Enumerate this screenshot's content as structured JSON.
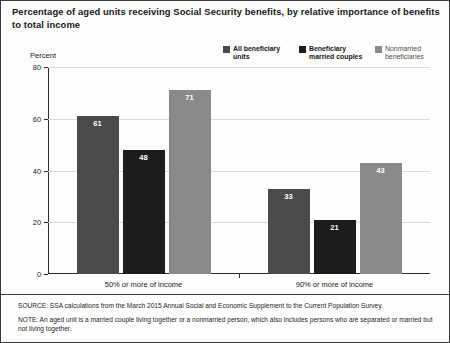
{
  "title": "Percentage of aged units receiving Social Security benefits, by relative importance of benefits to total income",
  "axis_caption": "Percent",
  "legend": {
    "items": [
      {
        "label": "All beneficiary\nunits",
        "color": "#4a4a4a"
      },
      {
        "label": "Beneficiary\nmarried couples",
        "color": "#1c1c1c"
      },
      {
        "label": "Nonmarried\nbeneficiaries",
        "color": "#8a8a8a"
      }
    ]
  },
  "notes": {
    "source": "SOURCE: SSA calculations from the March 2015 Annual Social and Economic Supplement to the Current Population Survey.",
    "note": "NOTE: An aged unit is a married couple living together or a nonmarried person, which also includes persons who are separated or married but not living together."
  },
  "chart_data": {
    "type": "bar",
    "title": "Percentage of aged units receiving Social Security benefits, by relative importance of benefits to total income",
    "xlabel": "",
    "ylabel": "Percent",
    "ylim": [
      0,
      80
    ],
    "yticks": [
      0,
      20,
      40,
      60,
      80
    ],
    "grid": true,
    "legend_position": "top-right",
    "categories": [
      "50% or more of income",
      "90% or more of income"
    ],
    "series": [
      {
        "name": "All beneficiary units",
        "color": "#4a4a4a",
        "values": [
          61,
          33
        ]
      },
      {
        "name": "Beneficiary married couples",
        "color": "#1c1c1c",
        "values": [
          48,
          21
        ]
      },
      {
        "name": "Nonmarried beneficiaries",
        "color": "#8a8a8a",
        "values": [
          71,
          43
        ]
      }
    ]
  }
}
